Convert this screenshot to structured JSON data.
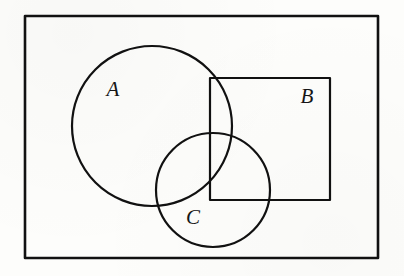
{
  "figure": {
    "kind": "set-diagram",
    "canvas": {
      "width": 404,
      "height": 276
    },
    "background_color": "#fdfdfb",
    "stroke_color": "#111111",
    "label_color": "#151515"
  },
  "shapes": {
    "universe_rect": {
      "name": "universal-set-rectangle",
      "x": 25,
      "y": 16,
      "width": 353,
      "height": 242,
      "stroke_width": 2.6
    },
    "rect_b": {
      "name": "set-b-rectangle",
      "x": 210,
      "y": 78,
      "width": 120,
      "height": 122,
      "stroke_width": 2.2
    },
    "circle_a": {
      "name": "set-a-circle",
      "cx": 152,
      "cy": 126,
      "r": 80,
      "stroke_width": 2.2
    },
    "circle_c": {
      "name": "set-c-circle",
      "cx": 213,
      "cy": 190,
      "r": 57,
      "stroke_width": 2.2
    }
  },
  "labels": [
    {
      "id": "a",
      "text": "A",
      "x": 113,
      "y": 96,
      "font_size": 21
    },
    {
      "id": "b",
      "text": "B",
      "x": 307,
      "y": 103,
      "font_size": 21
    },
    {
      "id": "c",
      "text": "C",
      "x": 193,
      "y": 224,
      "font_size": 21
    }
  ]
}
